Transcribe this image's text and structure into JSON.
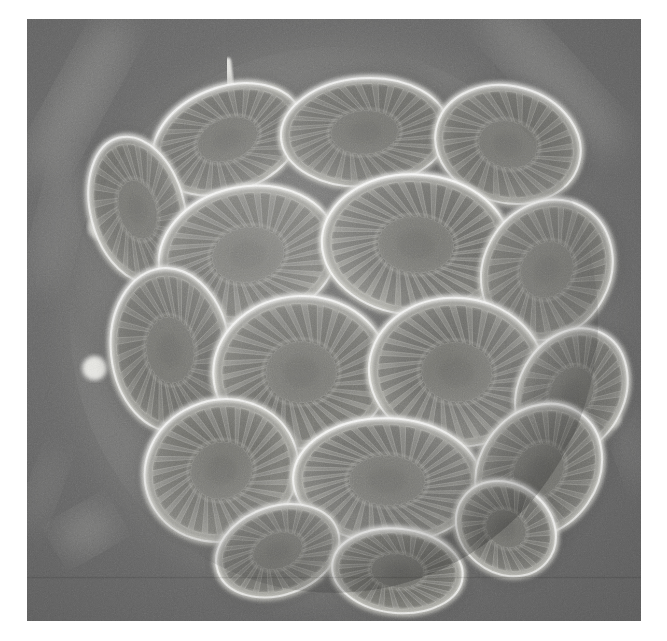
{
  "figure": {
    "kind": "scanning-electron-micrograph",
    "caption": "",
    "border_color": "#ffffff",
    "background_color": "#676767",
    "highlight_color": "#f2f2ee",
    "shadow_color": "#3b3b3b",
    "plate_face_color": "#8a8a86",
    "photo": {
      "x": 27,
      "y": 19,
      "width": 614,
      "height": 602
    }
  },
  "scene": {
    "cell_outline": {
      "cx": 300,
      "cy": 300,
      "rx": 252,
      "ry": 268,
      "rotation": -6
    },
    "background_streaks": [
      {
        "name": "streak-top-left",
        "cx": 52,
        "cy": 78,
        "rx": 24,
        "ry": 92,
        "rot": 28,
        "opacity": 0.2
      },
      {
        "name": "streak-top-right",
        "cx": 512,
        "cy": 58,
        "rx": 26,
        "ry": 100,
        "rot": -42,
        "opacity": 0.18
      },
      {
        "name": "streak-left-mid",
        "cx": 30,
        "cy": 205,
        "rx": 20,
        "ry": 70,
        "rot": 14,
        "opacity": 0.14
      },
      {
        "name": "blob-lower-left",
        "cx": 58,
        "cy": 510,
        "rx": 30,
        "ry": 22,
        "rot": -30,
        "opacity": 0.22
      },
      {
        "name": "streak-lower-left",
        "cx": 16,
        "cy": 470,
        "rx": 14,
        "ry": 44,
        "rot": 20,
        "opacity": 0.12
      },
      {
        "name": "streak-bottom-right",
        "cx": 592,
        "cy": 430,
        "rx": 16,
        "ry": 40,
        "rot": -20,
        "opacity": 0.1
      }
    ],
    "spines": [
      {
        "name": "spine-top",
        "x1": 201,
        "y1": 88,
        "x2": 196,
        "y2": 42,
        "w": 7
      },
      {
        "name": "nub-left-upper",
        "cx": 71,
        "cy": 208,
        "r": 11
      },
      {
        "name": "nub-left-lower",
        "cx": 66,
        "cy": 348,
        "r": 12
      },
      {
        "name": "nub-right",
        "cx": 570,
        "cy": 398,
        "r": 10
      }
    ],
    "coccoliths": [
      {
        "id": "cl-top-left-tilted",
        "cx": 196,
        "cy": 120,
        "rx": 76,
        "ry": 52,
        "rot": -22,
        "rays": 26,
        "tilt": 0.62,
        "bright": 0.95
      },
      {
        "id": "cl-top-center",
        "cx": 330,
        "cy": 113,
        "rx": 82,
        "ry": 54,
        "rot": -4,
        "rays": 28,
        "tilt": 0.58,
        "bright": 0.92
      },
      {
        "id": "cl-top-right",
        "cx": 470,
        "cy": 125,
        "rx": 72,
        "ry": 58,
        "rot": 16,
        "rays": 24,
        "tilt": 0.55,
        "bright": 0.88
      },
      {
        "id": "cl-upper-left-edge",
        "cx": 108,
        "cy": 190,
        "rx": 46,
        "ry": 74,
        "rot": -14,
        "rays": 22,
        "tilt": 0.4,
        "bright": 0.86
      },
      {
        "id": "cl-mid-upper-left",
        "cx": 216,
        "cy": 235,
        "rx": 88,
        "ry": 68,
        "rot": -12,
        "rays": 30,
        "tilt": 0.8,
        "bright": 0.96
      },
      {
        "id": "cl-mid-upper-center",
        "cx": 380,
        "cy": 225,
        "rx": 92,
        "ry": 70,
        "rot": 4,
        "rays": 32,
        "tilt": 0.88,
        "bright": 1.0
      },
      {
        "id": "cl-mid-upper-right",
        "cx": 508,
        "cy": 250,
        "rx": 62,
        "ry": 72,
        "rot": 28,
        "rays": 24,
        "tilt": 0.52,
        "bright": 0.84
      },
      {
        "id": "cl-mid-left",
        "cx": 140,
        "cy": 330,
        "rx": 58,
        "ry": 82,
        "rot": -6,
        "rays": 26,
        "tilt": 0.48,
        "bright": 0.9
      },
      {
        "id": "cl-center-left",
        "cx": 268,
        "cy": 352,
        "rx": 86,
        "ry": 76,
        "rot": -2,
        "rays": 30,
        "tilt": 0.84,
        "bright": 0.94
      },
      {
        "id": "cl-center-right",
        "cx": 420,
        "cy": 352,
        "rx": 86,
        "ry": 74,
        "rot": 6,
        "rays": 30,
        "tilt": 0.82,
        "bright": 0.93
      },
      {
        "id": "cl-mid-right-edge",
        "cx": 532,
        "cy": 372,
        "rx": 52,
        "ry": 66,
        "rot": 26,
        "rays": 22,
        "tilt": 0.46,
        "bright": 0.82
      },
      {
        "id": "cl-lower-left",
        "cx": 190,
        "cy": 450,
        "rx": 76,
        "ry": 70,
        "rot": -24,
        "rays": 28,
        "tilt": 0.74,
        "bright": 0.92
      },
      {
        "id": "cl-lower-center",
        "cx": 352,
        "cy": 460,
        "rx": 92,
        "ry": 62,
        "rot": 2,
        "rays": 32,
        "tilt": 0.86,
        "bright": 0.98
      },
      {
        "id": "cl-lower-right",
        "cx": 500,
        "cy": 450,
        "rx": 58,
        "ry": 70,
        "rot": 34,
        "rays": 24,
        "tilt": 0.5,
        "bright": 0.85
      },
      {
        "id": "cl-bottom-left",
        "cx": 245,
        "cy": 530,
        "rx": 62,
        "ry": 44,
        "rot": -20,
        "rays": 22,
        "tilt": 0.5,
        "bright": 0.88
      },
      {
        "id": "cl-bottom-center",
        "cx": 362,
        "cy": 550,
        "rx": 64,
        "ry": 42,
        "rot": 6,
        "rays": 24,
        "tilt": 0.54,
        "bright": 0.95
      },
      {
        "id": "cl-bottom-right",
        "cx": 468,
        "cy": 508,
        "rx": 52,
        "ry": 44,
        "rot": 40,
        "rays": 20,
        "tilt": 0.48,
        "bright": 0.86
      }
    ]
  }
}
